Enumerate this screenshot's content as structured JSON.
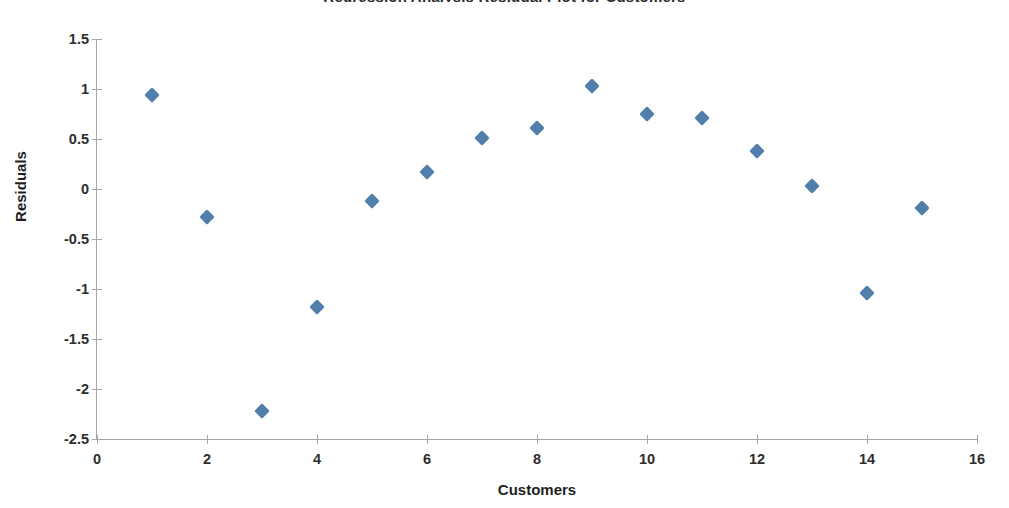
{
  "chart_data": {
    "type": "scatter",
    "title": "Regression Analysis Residual Plot for Customers",
    "xlabel": "Customers",
    "ylabel": "Residuals",
    "xlim": [
      0,
      16
    ],
    "ylim": [
      -2.5,
      1.5
    ],
    "xticks": [
      0,
      2,
      4,
      6,
      8,
      10,
      12,
      14,
      16
    ],
    "xtick_labels": [
      "0",
      "2",
      "4",
      "6",
      "8",
      "10",
      "12",
      "14",
      "16"
    ],
    "yticks": [
      1.5,
      1,
      0.5,
      0,
      -0.5,
      -1,
      -1.5,
      -2,
      -2.5
    ],
    "ytick_labels": [
      "1.5",
      "1",
      "0.5",
      "0",
      "-0.5",
      "-1",
      "-1.5",
      "-2",
      "-2.5"
    ],
    "grid": false,
    "legend": false,
    "marker": "diamond",
    "marker_color": "#4f7faa",
    "axis_color": "#a6a6a6",
    "series": [
      {
        "name": "Residuals",
        "x": [
          1,
          2,
          3,
          4,
          5,
          6,
          7,
          8,
          9,
          10,
          11,
          12,
          13,
          14,
          15
        ],
        "values": [
          0.94,
          -0.28,
          -2.22,
          -1.18,
          -0.12,
          0.17,
          0.51,
          0.61,
          1.03,
          0.75,
          0.71,
          0.38,
          0.03,
          -1.04,
          -0.19
        ]
      }
    ]
  }
}
